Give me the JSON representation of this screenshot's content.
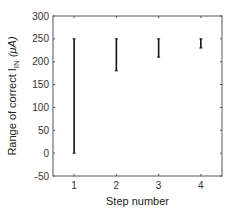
{
  "chart_data": {
    "type": "errorbar",
    "title": "",
    "xlabel": "Step number",
    "ylabel": "Range of correct I_IN (μA)",
    "ylabel_parts": {
      "prefix": "Range of correct I",
      "subscript": "IN",
      "suffix": " (μA)"
    },
    "categories": [
      "1",
      "2",
      "3",
      "4"
    ],
    "x": [
      1,
      2,
      3,
      4
    ],
    "ranges": [
      {
        "step": 1,
        "low": 0,
        "high": 250
      },
      {
        "step": 2,
        "low": 180,
        "high": 250
      },
      {
        "step": 3,
        "low": 210,
        "high": 250
      },
      {
        "step": 4,
        "low": 230,
        "high": 250
      }
    ],
    "xlim": [
      0.5,
      4.5
    ],
    "ylim": [
      -50,
      300
    ],
    "yticks": [
      -50,
      0,
      50,
      100,
      150,
      200,
      250,
      300
    ],
    "xticks": [
      1,
      2,
      3,
      4
    ],
    "grid": false,
    "legend": null,
    "colors": {
      "bar": "#111111",
      "axis": "#555555",
      "text": "#333333"
    }
  }
}
